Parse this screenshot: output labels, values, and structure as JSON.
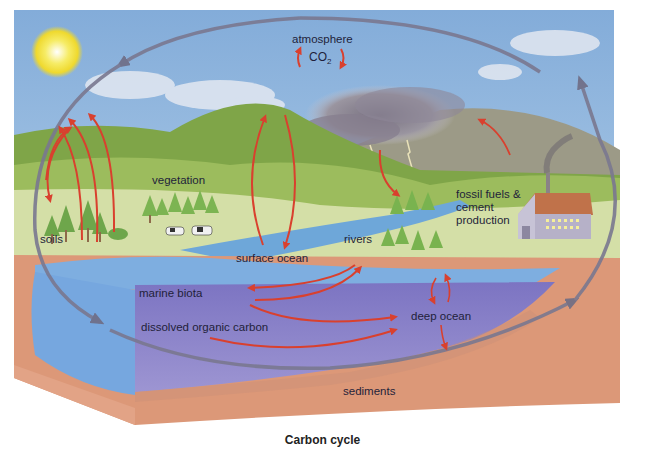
{
  "title": "Carbon cycle",
  "labels": {
    "atmosphere": "atmosphere",
    "co2_main": "CO",
    "co2_sub": "2",
    "vegetation": "vegetation",
    "soils": "soils",
    "surface_ocean": "surface ocean",
    "rivers": "rivers",
    "fossil_fuels_line1": "fossil fuels &",
    "fossil_fuels_line2": "cement",
    "fossil_fuels_line3": "production",
    "marine_biota": "marine biota",
    "dissolved_organic_carbon": "dissolved organic carbon",
    "deep_ocean": "deep ocean",
    "sediments": "sediments"
  },
  "colors": {
    "sky": "#8fb4dc",
    "hill_dark": "#6f9a3c",
    "hill_light": "#a9c46a",
    "meadow": "#d5dfa8",
    "ocean_surface": "#7eaee0",
    "ocean_deep": "#8a80c8",
    "earth": "#dd9a7a",
    "cycle_arrow_gray": "#7a7890",
    "flux_arrow_red": "#d9402e",
    "cloud_storm": "#8a8592",
    "mountain": "#9a9a88",
    "sun": "#f3e23a"
  }
}
